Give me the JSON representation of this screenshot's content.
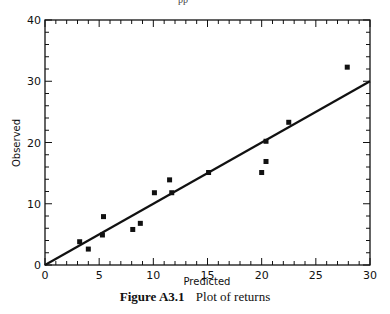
{
  "header": {
    "cropped_text": "pp"
  },
  "caption": {
    "figure_label": "Figure A3.1",
    "text": "Plot of returns"
  },
  "chart_data": {
    "type": "scatter",
    "title": "Plot of returns",
    "xlabel": "Predicted",
    "ylabel": "Observed",
    "xlim": [
      0,
      30
    ],
    "ylim": [
      0,
      40
    ],
    "xticks": [
      0,
      5,
      10,
      15,
      20,
      25,
      30
    ],
    "yticks": [
      0,
      10,
      20,
      30,
      40
    ],
    "grid": false,
    "legend": null,
    "series": [
      {
        "name": "Returns",
        "type": "scatter",
        "marker": "square",
        "x": [
          3.2,
          4.0,
          5.3,
          5.4,
          8.1,
          8.8,
          10.1,
          11.5,
          11.7,
          15.1,
          20.0,
          20.4,
          20.4,
          22.5,
          27.9
        ],
        "y": [
          3.8,
          2.6,
          4.9,
          7.9,
          5.8,
          6.8,
          11.8,
          13.9,
          11.8,
          15.1,
          15.1,
          16.9,
          20.2,
          23.3,
          32.3
        ]
      },
      {
        "name": "Fitted line (y = x)",
        "type": "line",
        "x": [
          0,
          30
        ],
        "y": [
          0,
          30
        ]
      }
    ]
  }
}
